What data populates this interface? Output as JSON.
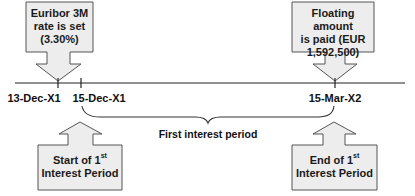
{
  "colors": {
    "box_fill": "#ededed",
    "box_stroke": "#555555",
    "line": "#222222",
    "text": "#111111"
  },
  "timeline": {
    "dates": [
      {
        "label": "13-Dec-X1",
        "x": 58
      },
      {
        "label": "15-Dec-X1",
        "x": 81
      },
      {
        "label": "15-Mar-X2",
        "x": 335
      }
    ]
  },
  "period": {
    "label": "First interest period"
  },
  "callouts": {
    "top_left": {
      "lines": [
        "Euribor 3M",
        "rate is set",
        "(3.30%)"
      ],
      "direction": "down-arrow"
    },
    "top_right": {
      "lines": [
        "Floating amount",
        "is paid (EUR",
        "1,592,500)"
      ],
      "direction": "down-arrow"
    },
    "bottom_left": {
      "line1_prefix": "Start of 1",
      "line1_sup": "st",
      "line2": "Interest Period",
      "direction": "up-arrow"
    },
    "bottom_right": {
      "line1_prefix": "End of 1",
      "line1_sup": "st",
      "line2": "Interest Period",
      "direction": "up-arrow"
    }
  }
}
